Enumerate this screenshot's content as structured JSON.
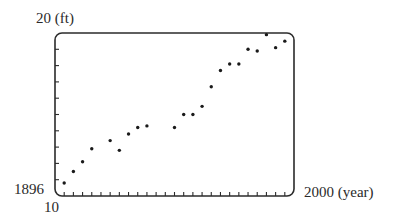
{
  "labels": {
    "y_max": "20 (ft)",
    "x_min": "1896",
    "y_min": "10",
    "x_max": "2000 (year)"
  },
  "chart_data": {
    "type": "scatter",
    "title": "",
    "xlabel": "year",
    "ylabel": "ft",
    "xlim": [
      1896,
      2000
    ],
    "ylim": [
      10,
      20
    ],
    "x_tick_step": 4,
    "y_tick_step": 1,
    "grid": false,
    "legend": null,
    "frame": "rounded-rectangle",
    "series": [
      {
        "name": "points",
        "x": [
          1900,
          1904,
          1908,
          1912,
          1920,
          1924,
          1928,
          1932,
          1936,
          1948,
          1952,
          1956,
          1960,
          1964,
          1968,
          1972,
          1976,
          1980,
          1984,
          1988,
          1992,
          1996
        ],
        "y": [
          10.8,
          11.5,
          12.1,
          12.9,
          13.4,
          12.8,
          13.8,
          14.2,
          14.3,
          14.2,
          15.0,
          15.0,
          15.5,
          16.7,
          17.7,
          18.1,
          18.1,
          19.0,
          18.9,
          19.9,
          19.1,
          19.5
        ]
      }
    ]
  },
  "style": {
    "frame_color": "#2b2b2b",
    "point_color": "#1a1a1a"
  }
}
